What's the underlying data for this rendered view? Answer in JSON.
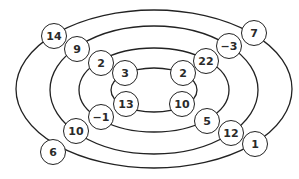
{
  "diagram": {
    "type": "concentric-ellipses-with-numbered-nodes",
    "ellipses": [
      {
        "name": "outer",
        "cx": 154,
        "cy": 89,
        "rx": 138,
        "ry": 79
      },
      {
        "name": "second",
        "cx": 154,
        "cy": 90,
        "rx": 104,
        "ry": 64
      },
      {
        "name": "third",
        "cx": 154,
        "cy": 90,
        "rx": 75,
        "ry": 42
      },
      {
        "name": "inner",
        "cx": 154,
        "cy": 90,
        "rx": 43,
        "ry": 22
      }
    ],
    "nodes": [
      {
        "id": "n1",
        "value": "14",
        "ring": "outer",
        "quadrant": "top-left",
        "x": 54,
        "y": 36
      },
      {
        "id": "n2",
        "value": "9",
        "ring": "second",
        "quadrant": "top-left",
        "x": 77,
        "y": 49
      },
      {
        "id": "n3",
        "value": "2",
        "ring": "third",
        "quadrant": "top-left",
        "x": 101,
        "y": 63
      },
      {
        "id": "n4",
        "value": "3",
        "ring": "inner",
        "quadrant": "top-left",
        "x": 125,
        "y": 73
      },
      {
        "id": "n5",
        "value": "7",
        "ring": "outer",
        "quadrant": "top-right",
        "x": 254,
        "y": 33
      },
      {
        "id": "n6",
        "value": "−3",
        "ring": "second",
        "quadrant": "top-right",
        "x": 229,
        "y": 46
      },
      {
        "id": "n7",
        "value": "22",
        "ring": "third",
        "quadrant": "top-right",
        "x": 206,
        "y": 61
      },
      {
        "id": "n8",
        "value": "2",
        "ring": "inner",
        "quadrant": "top-right",
        "x": 183,
        "y": 73
      },
      {
        "id": "n9",
        "value": "13",
        "ring": "inner",
        "quadrant": "bottom-left",
        "x": 126,
        "y": 104
      },
      {
        "id": "n10",
        "value": "−1",
        "ring": "third",
        "quadrant": "bottom-left",
        "x": 101,
        "y": 117
      },
      {
        "id": "n11",
        "value": "10",
        "ring": "second",
        "quadrant": "bottom-left",
        "x": 76,
        "y": 131
      },
      {
        "id": "n12",
        "value": "6",
        "ring": "outer",
        "quadrant": "bottom-left",
        "x": 53,
        "y": 152
      },
      {
        "id": "n13",
        "value": "10",
        "ring": "inner",
        "quadrant": "bottom-right",
        "x": 182,
        "y": 104
      },
      {
        "id": "n14",
        "value": "5",
        "ring": "third",
        "quadrant": "bottom-right",
        "x": 207,
        "y": 121
      },
      {
        "id": "n15",
        "value": "12",
        "ring": "second",
        "quadrant": "bottom-right",
        "x": 231,
        "y": 133
      },
      {
        "id": "n16",
        "value": "1",
        "ring": "outer",
        "quadrant": "bottom-right",
        "x": 255,
        "y": 144
      }
    ],
    "colors": {
      "stroke": "#222222",
      "background": "#ffffff",
      "text": "#2a2a2a"
    }
  }
}
